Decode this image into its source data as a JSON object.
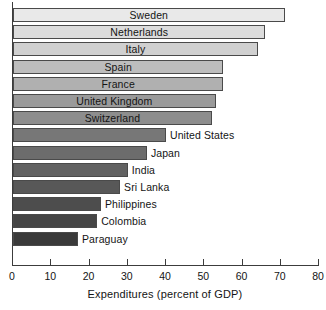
{
  "chart_data": {
    "type": "bar",
    "orientation": "horizontal",
    "title": "",
    "xlabel": "Expenditures (percent of GDP)",
    "ylabel": "",
    "xlim": [
      0,
      80
    ],
    "xticks": [
      0,
      10,
      20,
      30,
      40,
      50,
      60,
      70,
      80
    ],
    "xtick_labels": [
      "0",
      "10",
      "20",
      "30",
      "40",
      "50",
      "60",
      "70",
      "80"
    ],
    "grid": false,
    "legend": false,
    "categories": [
      "Sweden",
      "Netherlands",
      "Italy",
      "Spain",
      "France",
      "United Kingdom",
      "Switzerland",
      "United States",
      "Japan",
      "India",
      "Sri Lanka",
      "Philippines",
      "Colombia",
      "Paraguay"
    ],
    "values": [
      71,
      66,
      64,
      55,
      55,
      53,
      52,
      40,
      35,
      30,
      28,
      23,
      22,
      17
    ],
    "bars": [
      {
        "label": "Sweden",
        "value": 71,
        "color": "#e9e9e9",
        "label_color": "#141414",
        "label_position": "inside"
      },
      {
        "label": "Netherlands",
        "value": 66,
        "color": "#dcdcdc",
        "label_color": "#141414",
        "label_position": "inside"
      },
      {
        "label": "Italy",
        "value": 64,
        "color": "#d0d0d0",
        "label_color": "#141414",
        "label_position": "inside"
      },
      {
        "label": "Spain",
        "value": 55,
        "color": "#bdbdbd",
        "label_color": "#141414",
        "label_position": "inside"
      },
      {
        "label": "France",
        "value": 55,
        "color": "#b0b0b0",
        "label_color": "#141414",
        "label_position": "inside"
      },
      {
        "label": "United Kingdom",
        "value": 53,
        "color": "#9a9a9a",
        "label_color": "#141414",
        "label_position": "inside"
      },
      {
        "label": "Switzerland",
        "value": 52,
        "color": "#8d8d8d",
        "label_color": "#141414",
        "label_position": "inside"
      },
      {
        "label": "United States",
        "value": 40,
        "color": "#777777",
        "label_color": "#141414",
        "label_position": "outside"
      },
      {
        "label": "Japan",
        "value": 35,
        "color": "#6c6c6c",
        "label_color": "#141414",
        "label_position": "outside"
      },
      {
        "label": "India",
        "value": 30,
        "color": "#626262",
        "label_color": "#141414",
        "label_position": "outside"
      },
      {
        "label": "Sri Lanka",
        "value": 28,
        "color": "#585858",
        "label_color": "#141414",
        "label_position": "outside"
      },
      {
        "label": "Philippines",
        "value": 23,
        "color": "#4d4d4d",
        "label_color": "#141414",
        "label_position": "outside"
      },
      {
        "label": "Colombia",
        "value": 22,
        "color": "#454545",
        "label_color": "#141414",
        "label_position": "outside"
      },
      {
        "label": "Paraguay",
        "value": 17,
        "color": "#3a3a3a",
        "label_color": "#141414",
        "label_position": "outside"
      }
    ],
    "axis_color": "#3c3c3c",
    "bar_border_color": "#4a4a4a",
    "background": "#ffffff"
  }
}
